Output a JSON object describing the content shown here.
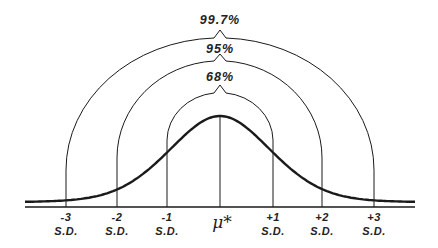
{
  "diagram": {
    "title": "",
    "mean_label": "μ*",
    "brackets": [
      {
        "label": "99.7%",
        "range_sd": 3
      },
      {
        "label": "95%",
        "range_sd": 2
      },
      {
        "label": "68%",
        "range_sd": 1
      }
    ],
    "ticks": [
      {
        "value": "-3",
        "unit": "S.D."
      },
      {
        "value": "-2",
        "unit": "S.D."
      },
      {
        "value": "-1",
        "unit": "S.D."
      },
      {
        "value": "+1",
        "unit": "S.D."
      },
      {
        "value": "+2",
        "unit": "S.D."
      },
      {
        "value": "+3",
        "unit": "S.D."
      }
    ],
    "colors": {
      "line": "#1a1a1a",
      "background": "#ffffff"
    }
  }
}
